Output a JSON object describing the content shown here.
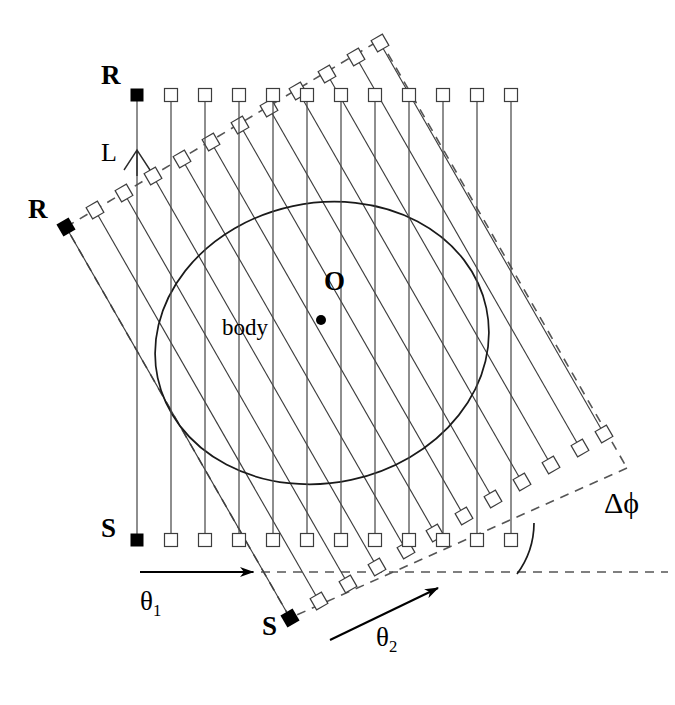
{
  "figure": {
    "type": "diagram",
    "background_color": "#ffffff",
    "stroke_color": "#000000",
    "line_color": "#3a3a3a",
    "dash_color": "#555555"
  },
  "labels": {
    "receiver_vertical": "R",
    "receiver_slanted": "R",
    "source_vertical": "S",
    "source_slanted": "S",
    "ray_length": "L",
    "body": "body",
    "origin": "O",
    "theta1_base": "θ",
    "theta1_sub": "1",
    "theta2_base": "θ",
    "theta2_sub": "2",
    "delta_phi": "Δϕ"
  },
  "label_positions": {
    "receiver_vertical": {
      "x": 101,
      "y": 71
    },
    "receiver_slanted": {
      "x": 28,
      "y": 205
    },
    "source_vertical": {
      "x": 101,
      "y": 524
    },
    "source_slanted": {
      "x": 262,
      "y": 622
    },
    "ray_length": {
      "x": 101,
      "y": 139
    },
    "body": {
      "x": 222,
      "y": 323
    },
    "origin": {
      "x": 324,
      "y": 275
    },
    "theta1": {
      "x": 140,
      "y": 600
    },
    "theta2": {
      "x": 376,
      "y": 634
    },
    "delta_phi": {
      "x": 604,
      "y": 500
    }
  },
  "scan_vertical": {
    "name": "theta1-scan",
    "angle_deg": 90,
    "n_rays": 12,
    "spacing_px": 34,
    "x_start": 137,
    "y_top": 95,
    "y_bottom": 540,
    "marker_size": 13,
    "filled_index": 0
  },
  "scan_slanted": {
    "name": "theta2-scan",
    "angle_deg": 60,
    "rotation_deg": -30,
    "n_rays": 12,
    "spacing_px": 34,
    "marker_size": 13,
    "filled_index": 0
  },
  "body_ellipse": {
    "center_x": 322,
    "center_y": 343,
    "radius_x": 168,
    "radius_y": 140,
    "rotation_deg": -12
  },
  "origin_point": {
    "x": 321,
    "y": 320,
    "radius": 5
  },
  "arrows": {
    "theta1": {
      "x1": 140,
      "y1": 572,
      "x2": 253,
      "y2": 572
    },
    "theta2": {
      "x1": 330,
      "y1": 640,
      "x2": 438,
      "y2": 588
    }
  },
  "delta_phi_arc": {
    "center_x": 603,
    "center_y": 574,
    "radius": 86,
    "start_deg": 180,
    "end_deg": 210
  },
  "baseline_dashed": {
    "x1": 245,
    "y1": 572,
    "x2": 668,
    "y2": 572
  }
}
